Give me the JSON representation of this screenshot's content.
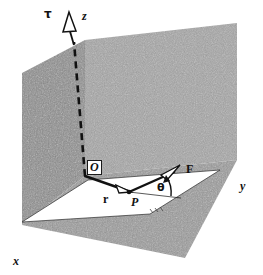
{
  "figure": {
    "kind": "physics-vector-diagram",
    "width": 263,
    "height": 275,
    "background_color": "#ffffff"
  },
  "labels": {
    "tau": "τ",
    "z_axis": "z",
    "y_axis": "y",
    "x_axis": "x",
    "origin": "O",
    "point_p": "P",
    "r_vector": "r",
    "f_vector": "F",
    "theta": "θ"
  },
  "colors": {
    "wall_left": "#8c8c8c",
    "wall_right": "#a3a3a3",
    "floor": "#999999",
    "plane_fill": "#ffffff",
    "ink": "#111111",
    "label_box_fill": "#ffffff"
  },
  "geometry": {
    "origin_point": [
      85,
      176
    ],
    "point_p": [
      128,
      191
    ],
    "f_tip": [
      177,
      170
    ],
    "tau_tip": [
      75,
      16
    ],
    "plane_vertices": [
      [
        22,
        222
      ],
      [
        88,
        180
      ],
      [
        220,
        170
      ],
      [
        150,
        214
      ]
    ],
    "wall_left_vertices": [
      [
        22,
        73
      ],
      [
        85,
        40
      ],
      [
        85,
        176
      ],
      [
        22,
        225
      ]
    ],
    "wall_right_vertices": [
      [
        85,
        40
      ],
      [
        237,
        23
      ],
      [
        237,
        160
      ],
      [
        85,
        176
      ]
    ],
    "floor_vertices": [
      [
        22,
        225
      ],
      [
        85,
        176
      ],
      [
        237,
        160
      ],
      [
        185,
        258
      ]
    ]
  },
  "annotations": {
    "z_axis_style": "dashed",
    "tau_arrowhead": "open-outline-triangle",
    "r_arrowhead": "open-outline-triangle",
    "f_arrowhead": "open-outline-triangle",
    "theta_arc": "curved-arrow-between-F-and-baseline"
  }
}
